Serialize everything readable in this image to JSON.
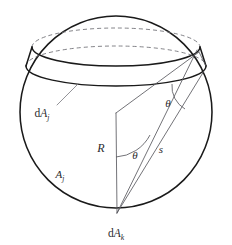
{
  "figure": {
    "type": "geometric-diagram",
    "background_color": "#ffffff",
    "stroke_color": "#1a1a1a",
    "construction_line_color": "#5a5a60",
    "hidden_line_color": "#6d6d72"
  },
  "labels": {
    "band_area_prefix": "d",
    "band_area_symbol": "A",
    "band_area_subscript": "j",
    "patch_area_prefix": "d",
    "patch_area_symbol": "A",
    "patch_area_subscript": "k",
    "zone_area_symbol": "A",
    "zone_area_subscript": "j",
    "radius_symbol": "R",
    "chord_symbol": "s",
    "angle_symbol_lower": "θ",
    "angle_symbol_upper": "θ"
  },
  "geometry": {
    "sphere": {
      "center_x": 116,
      "center_y": 112,
      "radius": 96
    },
    "upper_ring": {
      "center_x": 116,
      "center_y": 47,
      "rx": 84,
      "ry": 19,
      "back_half_hidden": true
    },
    "lower_ring": {
      "center_x": 116,
      "center_y": 66,
      "rx": 90,
      "ry": 20,
      "back_half_hidden": true
    },
    "cone_apex": {
      "x": 117,
      "y": 213
    },
    "center_vertex": {
      "x": 116,
      "y": 113
    },
    "band_right_edge_upper": {
      "x": 199,
      "y": 52
    },
    "band_right_edge_lower": {
      "x": 204,
      "y": 71
    },
    "lower_angle_vertex": {
      "x": 116,
      "y": 157
    },
    "lower_angle_degrees": 58,
    "upper_angle_degrees": 58
  },
  "label_positions": {
    "dAj": {
      "x": 42,
      "y": 112
    },
    "Aj": {
      "x": 60,
      "y": 174
    },
    "R": {
      "x": 101,
      "y": 148
    },
    "theta_lower": {
      "x": 134,
      "y": 155
    },
    "theta_upper": {
      "x": 167,
      "y": 103
    },
    "s": {
      "x": 161,
      "y": 150
    },
    "dAk": {
      "x": 116,
      "y": 233
    }
  }
}
